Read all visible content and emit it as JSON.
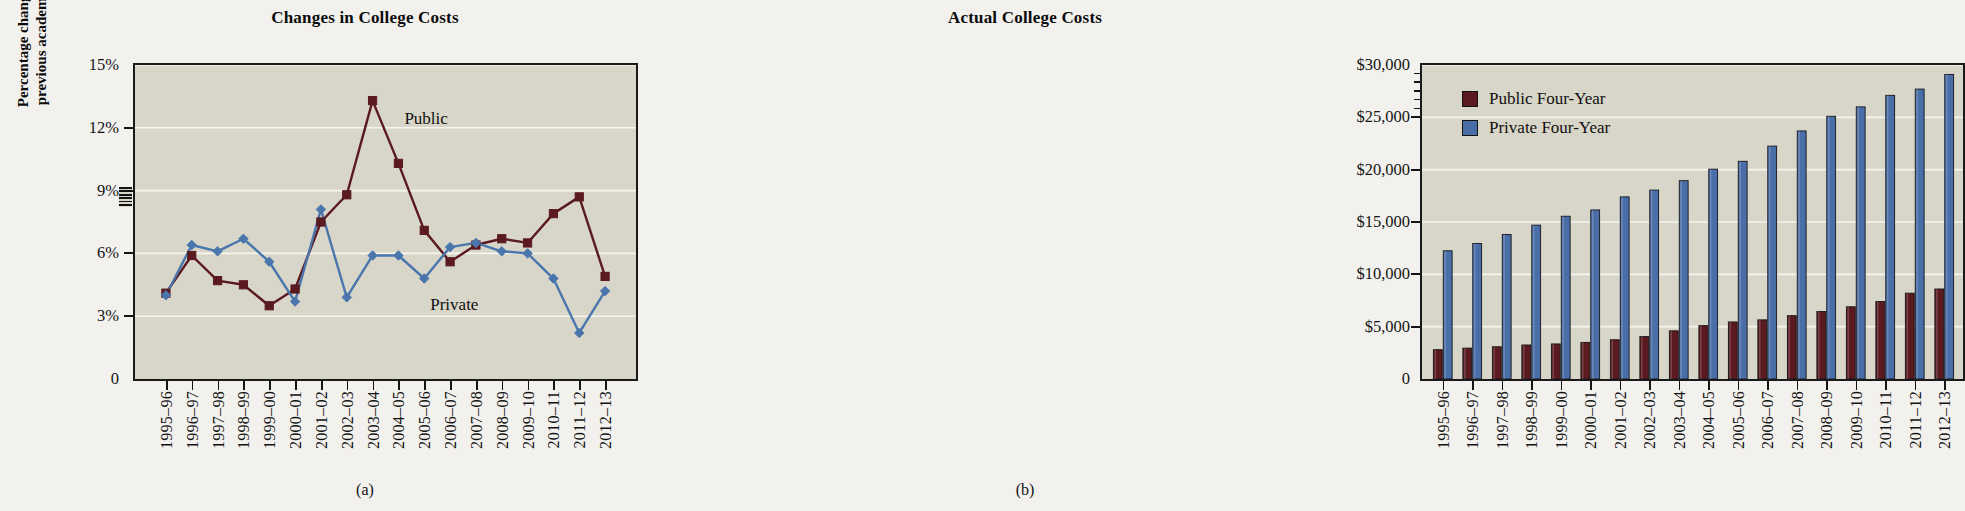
{
  "figure": {
    "panels": [
      {
        "caption": "(a)",
        "title": "Changes in College Costs"
      },
      {
        "caption": "(b)",
        "title": "Actual College Costs"
      }
    ]
  },
  "colors": {
    "public": "#5a1a20",
    "private": "#4a76ad",
    "private_bar": "#4a6fa8",
    "plot_bg": "#d8d6c8",
    "gridline": "#f6f5ef",
    "axis": "#151515",
    "page_bg": "#f2f1ee"
  },
  "panel_a": {
    "title": "Changes in College Costs",
    "caption": "(a)",
    "ylabel_line1": "Percentage change from",
    "ylabel_line2": "previous academic year",
    "series_label_public": "Public",
    "series_label_private": "Private",
    "ytick_labels": [
      "15%",
      "12%",
      "9%",
      "6%",
      "3%",
      "0"
    ],
    "has_axis_break": true
  },
  "panel_b": {
    "title": "Actual College Costs",
    "caption": "(b)",
    "ytick_labels": [
      "$30,000",
      "$25,000",
      "$20,000",
      "$15,000",
      "$10,000",
      "$5,000",
      "0"
    ],
    "legend": [
      {
        "label": "Public Four-Year",
        "color": "#5a1a20"
      },
      {
        "label": "Private Four-Year",
        "color": "#4a6fa8"
      }
    ]
  },
  "chart_data": [
    {
      "type": "line",
      "title": "Changes in College Costs",
      "xlabel": "",
      "ylabel": "Percentage change from previous academic year",
      "categories": [
        "1995–96",
        "1996–97",
        "1997–98",
        "1998–99",
        "1999–00",
        "2000–01",
        "2001–02",
        "2002–03",
        "2003–04",
        "2004–05",
        "2005–06",
        "2006–07",
        "2007–08",
        "2008–09",
        "2009–10",
        "2010–11",
        "2011–12",
        "2012–13"
      ],
      "ylim": [
        0,
        15
      ],
      "ytick_values": [
        0,
        3,
        6,
        9,
        12,
        15
      ],
      "ytick_labels": [
        "0",
        "3%",
        "6%",
        "9%",
        "12%",
        "15%"
      ],
      "grid": true,
      "legend_position": "inline-annotations",
      "series": [
        {
          "name": "Public",
          "color": "#5a1a20",
          "marker": "square",
          "values": [
            4.1,
            5.9,
            4.7,
            4.5,
            3.5,
            4.3,
            7.5,
            8.8,
            13.3,
            10.3,
            7.1,
            5.6,
            6.4,
            6.7,
            6.5,
            7.9,
            8.7,
            4.9
          ]
        },
        {
          "name": "Private",
          "color": "#4a76ad",
          "marker": "diamond",
          "values": [
            4.0,
            6.4,
            6.1,
            6.7,
            5.6,
            3.7,
            8.1,
            3.9,
            5.9,
            5.9,
            4.8,
            6.3,
            6.5,
            6.1,
            6.0,
            4.8,
            2.2,
            4.2
          ]
        }
      ]
    },
    {
      "type": "bar",
      "title": "Actual College Costs",
      "xlabel": "",
      "ylabel": "",
      "categories": [
        "1995–96",
        "1996–97",
        "1997–98",
        "1998–99",
        "1999–00",
        "2000–01",
        "2001–02",
        "2002–03",
        "2003–04",
        "2004–05",
        "2005–06",
        "2006–07",
        "2007–08",
        "2008–09",
        "2009–10",
        "2010–11",
        "2011–12",
        "2012–13"
      ],
      "ylim": [
        0,
        30000
      ],
      "ytick_values": [
        0,
        5000,
        10000,
        15000,
        20000,
        25000,
        30000
      ],
      "ytick_labels": [
        "0",
        "$5,000",
        "$10,000",
        "$15,000",
        "$20,000",
        "$25,000",
        "$30,000"
      ],
      "grid": true,
      "legend_position": "upper-left",
      "series": [
        {
          "name": "Public Four-Year",
          "color": "#5a1a20",
          "values": [
            2800,
            2950,
            3080,
            3250,
            3350,
            3500,
            3750,
            4050,
            4600,
            5100,
            5450,
            5650,
            6050,
            6450,
            6900,
            7400,
            8200,
            8600
          ]
        },
        {
          "name": "Private Four-Year",
          "color": "#4a6fa8",
          "values": [
            12250,
            12950,
            13800,
            14700,
            15550,
            16150,
            17400,
            18050,
            18950,
            20050,
            20800,
            22250,
            23700,
            25100,
            26000,
            27100,
            27700,
            29100
          ]
        }
      ]
    }
  ]
}
